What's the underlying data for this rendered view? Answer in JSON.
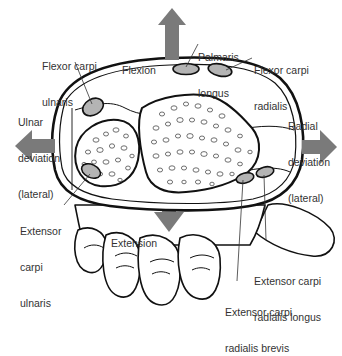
{
  "colors": {
    "arrow": "#7a7a7a",
    "tendon_fill": "#b4b4b4",
    "outline": "#111111",
    "text": "#333333",
    "background": "#ffffff"
  },
  "movements": {
    "flexion": "Flexion",
    "extension": "Extension",
    "ulnar_deviation": [
      "Ulnar",
      "deviation",
      "(lateral)"
    ],
    "radial_deviation": [
      "Radial",
      "deviation",
      "(lateral)"
    ]
  },
  "muscles": {
    "flexor_carpi_ulnaris": [
      "Flexor carpi",
      "ulnaris"
    ],
    "palmaris_longus": [
      "Palmaris",
      "longus"
    ],
    "flexor_carpi_radialis": [
      "Flexor carpi",
      "radialis"
    ],
    "extensor_carpi_ulnaris": [
      "Extensor",
      "carpi",
      "ulnaris"
    ],
    "extensor_carpi_radialis_longus": [
      "Extensor carpi",
      "radialis longus"
    ],
    "extensor_carpi_radialis_brevis": [
      "Extensor carpi",
      "radialis brevis"
    ]
  }
}
